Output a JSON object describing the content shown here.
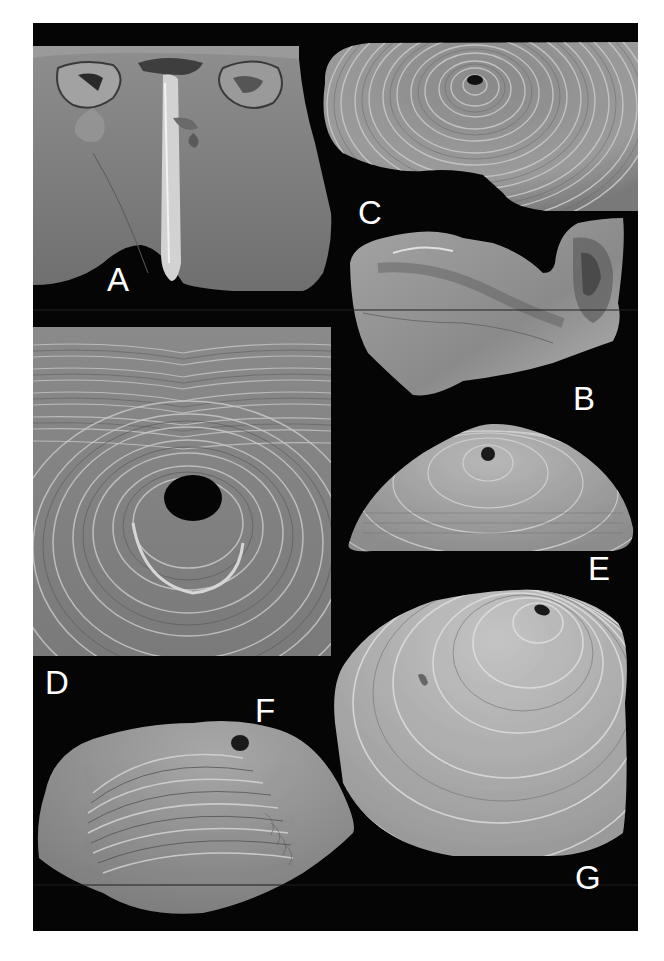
{
  "figure": {
    "type": "SEM photographic plate",
    "background_color": "#050505",
    "label_color": "#ffffff",
    "panels": [
      {
        "id": "A",
        "label": "A",
        "subject": "shell interior with median septum",
        "position": "top-left"
      },
      {
        "id": "B",
        "label": "B",
        "subject": "shell fragment, lateral view",
        "position": "right, second row"
      },
      {
        "id": "C",
        "label": "C",
        "subject": "shell exterior with concentric growth lines and pedicle foramen",
        "position": "top-right"
      },
      {
        "id": "D",
        "label": "D",
        "subject": "close-up of foramen and growth lamellae",
        "position": "left, middle"
      },
      {
        "id": "E",
        "label": "E",
        "subject": "shell exterior, posterior view with foramen",
        "position": "right, third row"
      },
      {
        "id": "F",
        "label": "F",
        "subject": "shell, oblique lateral view with foramen",
        "position": "bottom-left"
      },
      {
        "id": "G",
        "label": "G",
        "subject": "shell exterior, dorsal view with foramen",
        "position": "bottom-right"
      }
    ]
  }
}
